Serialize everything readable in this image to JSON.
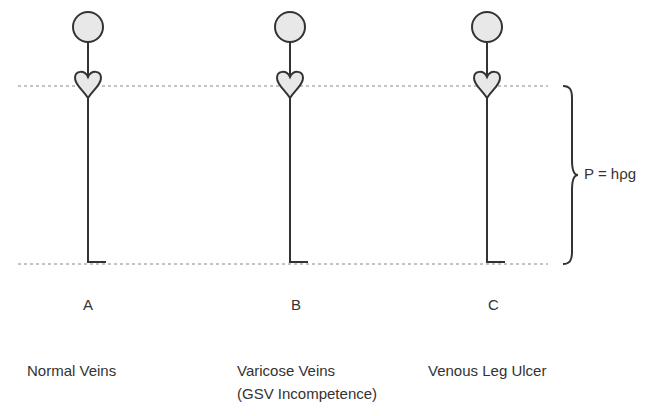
{
  "diagram": {
    "equation": "P = hρg",
    "figures": [
      {
        "letter": "A",
        "caption": [
          "Normal Veins"
        ]
      },
      {
        "letter": "B",
        "caption": [
          "Varicose Veins",
          "(GSV Incompetence)"
        ]
      },
      {
        "letter": "C",
        "caption": [
          "Venous Leg Ulcer"
        ]
      }
    ],
    "colors": {
      "stroke": "#333333",
      "head_fill": "#e8e8e8",
      "dotted": "#888888"
    }
  }
}
